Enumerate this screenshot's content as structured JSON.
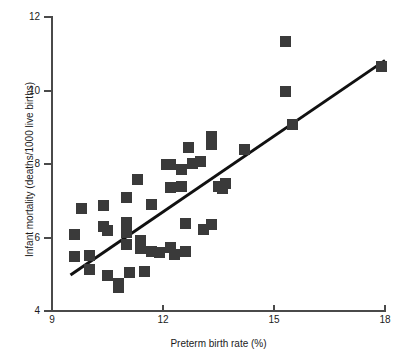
{
  "chart_data": {
    "type": "scatter",
    "title": "",
    "xlabel": "Preterm birth rate (%)",
    "ylabel": "Infant mortality (deaths/1000 live births)",
    "xlim": [
      9,
      18
    ],
    "ylim": [
      4,
      12
    ],
    "xticks": [
      9,
      12,
      15,
      18
    ],
    "yticks": [
      4,
      6,
      8,
      10,
      12
    ],
    "grid": false,
    "legend": null,
    "marker": {
      "shape": "square",
      "color": "#3a3a3a",
      "size_px": 11
    },
    "points": [
      {
        "x": 9.6,
        "y": 6.08
      },
      {
        "x": 9.6,
        "y": 5.48
      },
      {
        "x": 9.8,
        "y": 6.78
      },
      {
        "x": 10.0,
        "y": 5.5
      },
      {
        "x": 10.0,
        "y": 5.14
      },
      {
        "x": 10.4,
        "y": 6.88
      },
      {
        "x": 10.4,
        "y": 6.3
      },
      {
        "x": 10.5,
        "y": 6.18
      },
      {
        "x": 10.5,
        "y": 4.97
      },
      {
        "x": 10.8,
        "y": 4.74
      },
      {
        "x": 10.8,
        "y": 4.64
      },
      {
        "x": 11.0,
        "y": 7.08
      },
      {
        "x": 11.0,
        "y": 6.4
      },
      {
        "x": 11.0,
        "y": 6.14
      },
      {
        "x": 11.0,
        "y": 5.82
      },
      {
        "x": 11.1,
        "y": 5.05
      },
      {
        "x": 11.3,
        "y": 7.58
      },
      {
        "x": 11.4,
        "y": 5.93
      },
      {
        "x": 11.4,
        "y": 5.7
      },
      {
        "x": 11.5,
        "y": 5.08
      },
      {
        "x": 11.7,
        "y": 6.9
      },
      {
        "x": 11.7,
        "y": 5.61
      },
      {
        "x": 11.9,
        "y": 5.6
      },
      {
        "x": 12.1,
        "y": 8.0
      },
      {
        "x": 12.2,
        "y": 7.98
      },
      {
        "x": 12.2,
        "y": 7.36
      },
      {
        "x": 12.2,
        "y": 5.73
      },
      {
        "x": 12.3,
        "y": 5.55
      },
      {
        "x": 12.5,
        "y": 7.84
      },
      {
        "x": 12.5,
        "y": 7.4
      },
      {
        "x": 12.6,
        "y": 6.38
      },
      {
        "x": 12.6,
        "y": 5.62
      },
      {
        "x": 12.7,
        "y": 8.46
      },
      {
        "x": 12.8,
        "y": 8.02
      },
      {
        "x": 13.0,
        "y": 8.08
      },
      {
        "x": 13.1,
        "y": 6.22
      },
      {
        "x": 13.3,
        "y": 8.74
      },
      {
        "x": 13.3,
        "y": 8.54
      },
      {
        "x": 13.3,
        "y": 6.36
      },
      {
        "x": 13.5,
        "y": 7.4
      },
      {
        "x": 13.6,
        "y": 7.34
      },
      {
        "x": 13.7,
        "y": 7.46
      },
      {
        "x": 14.2,
        "y": 8.4
      },
      {
        "x": 15.3,
        "y": 11.34
      },
      {
        "x": 15.3,
        "y": 9.96
      },
      {
        "x": 15.5,
        "y": 9.08
      },
      {
        "x": 17.9,
        "y": 10.66
      }
    ],
    "trendline": {
      "type": "linear-fit",
      "x_start": 9.5,
      "y_start": 4.98,
      "x_end": 18.0,
      "y_end": 10.82
    }
  }
}
